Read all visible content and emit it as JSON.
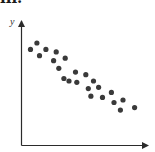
{
  "panel": {
    "label": "iii."
  },
  "colors": {
    "axis": "#2b2b2b",
    "point": "#3a3a3a",
    "background": "#ffffff"
  },
  "chart_data": {
    "type": "scatter",
    "title": "",
    "panel_label": "iii.",
    "xlabel": "",
    "ylabel": "y",
    "x_ticks": [],
    "y_ticks": [],
    "xlim": [
      0,
      10
    ],
    "ylim": [
      0,
      10
    ],
    "grid": false,
    "legend": null,
    "note": "Unscaled axes; coordinates normalized to 0-10. Pattern shows strong negative linear correlation.",
    "points": [
      {
        "x": 1.2,
        "y": 8.1
      },
      {
        "x": 0.7,
        "y": 7.6
      },
      {
        "x": 1.9,
        "y": 7.6
      },
      {
        "x": 1.4,
        "y": 7.1
      },
      {
        "x": 2.7,
        "y": 7.4
      },
      {
        "x": 2.5,
        "y": 6.7
      },
      {
        "x": 3.4,
        "y": 6.9
      },
      {
        "x": 2.9,
        "y": 6.1
      },
      {
        "x": 4.2,
        "y": 5.8
      },
      {
        "x": 3.3,
        "y": 5.3
      },
      {
        "x": 3.7,
        "y": 5.1
      },
      {
        "x": 4.3,
        "y": 5.0
      },
      {
        "x": 5.0,
        "y": 5.6
      },
      {
        "x": 5.6,
        "y": 5.1
      },
      {
        "x": 5.2,
        "y": 4.5
      },
      {
        "x": 6.0,
        "y": 4.6
      },
      {
        "x": 5.4,
        "y": 3.9
      },
      {
        "x": 6.3,
        "y": 3.8
      },
      {
        "x": 7.0,
        "y": 4.2
      },
      {
        "x": 7.2,
        "y": 3.4
      },
      {
        "x": 7.9,
        "y": 3.6
      },
      {
        "x": 7.7,
        "y": 2.8
      },
      {
        "x": 8.8,
        "y": 3.0
      }
    ]
  }
}
